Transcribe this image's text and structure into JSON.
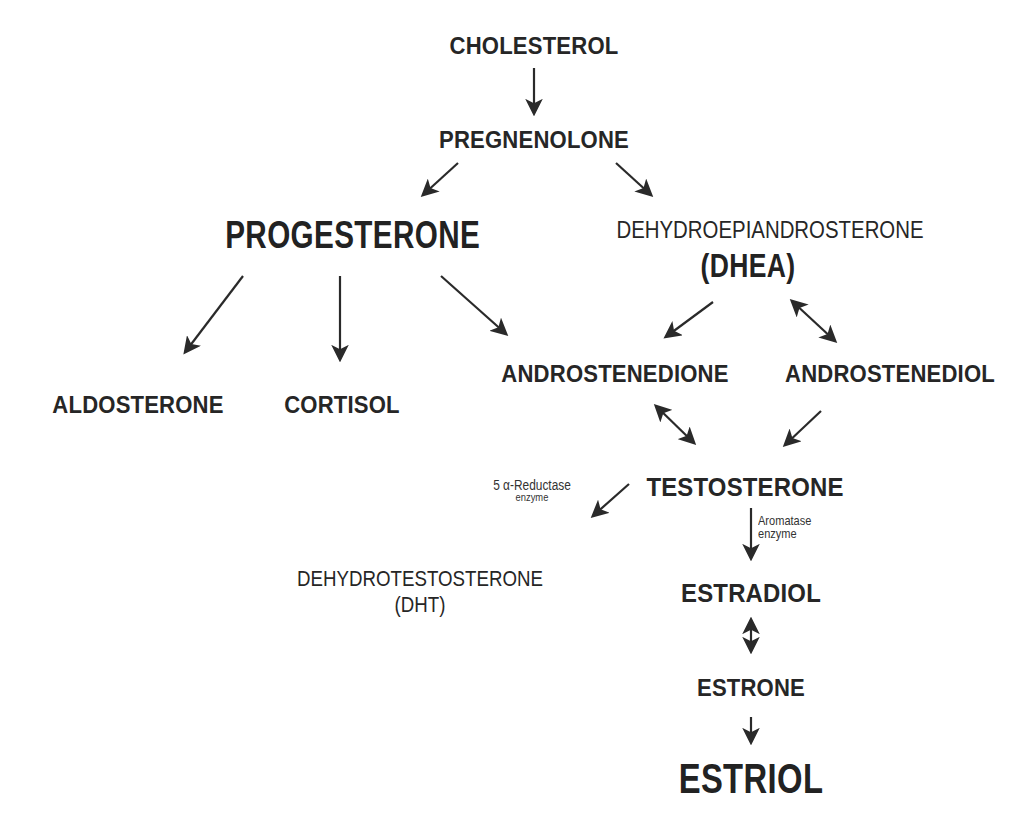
{
  "diagram": {
    "nodes": {
      "cholesterol": "CHOLESTEROL",
      "pregnenolone": "PREGNENOLONE",
      "progesterone": "PROGESTERONE",
      "dhea_full": "DEHYDROEPIANDROSTERONE",
      "dhea_abbr": "(DHEA)",
      "aldosterone": "ALDOSTERONE",
      "cortisol": "CORTISOL",
      "androstenedione": "ANDROSTENEDIONE",
      "androstenediol": "ANDROSTENEDIOL",
      "testosterone": "TESTOSTERONE",
      "dht_full": "DEHYDROTESTOSTERONE",
      "dht_abbr": "(DHT)",
      "estradiol": "ESTRADIOL",
      "estrone": "ESTRONE",
      "estriol": "ESTRIOL"
    },
    "annotations": {
      "reductase_line1": "5 α-Reductase",
      "reductase_line2": "enzyme",
      "aromatase_line1": "Aromatase",
      "aromatase_line2": "enzyme"
    },
    "edges": [
      {
        "from": "cholesterol",
        "to": "pregnenolone",
        "type": "one-way"
      },
      {
        "from": "pregnenolone",
        "to": "progesterone",
        "type": "one-way"
      },
      {
        "from": "pregnenolone",
        "to": "dhea",
        "type": "one-way"
      },
      {
        "from": "progesterone",
        "to": "aldosterone",
        "type": "one-way"
      },
      {
        "from": "progesterone",
        "to": "cortisol",
        "type": "one-way"
      },
      {
        "from": "progesterone",
        "to": "androstenedione",
        "type": "one-way"
      },
      {
        "from": "dhea",
        "to": "androstenedione",
        "type": "one-way"
      },
      {
        "from": "dhea",
        "to": "androstenediol",
        "type": "two-way"
      },
      {
        "from": "androstenedione",
        "to": "testosterone",
        "type": "two-way"
      },
      {
        "from": "androstenediol",
        "to": "testosterone",
        "type": "one-way"
      },
      {
        "from": "testosterone",
        "to": "dht",
        "type": "one-way",
        "label": "5 α-Reductase enzyme"
      },
      {
        "from": "testosterone",
        "to": "estradiol",
        "type": "one-way",
        "label": "Aromatase enzyme"
      },
      {
        "from": "estradiol",
        "to": "estrone",
        "type": "two-way"
      },
      {
        "from": "estrone",
        "to": "estriol",
        "type": "one-way"
      }
    ],
    "colors": {
      "text": "#262626",
      "arrow": "#2a2a2a",
      "background": "#ffffff"
    }
  }
}
